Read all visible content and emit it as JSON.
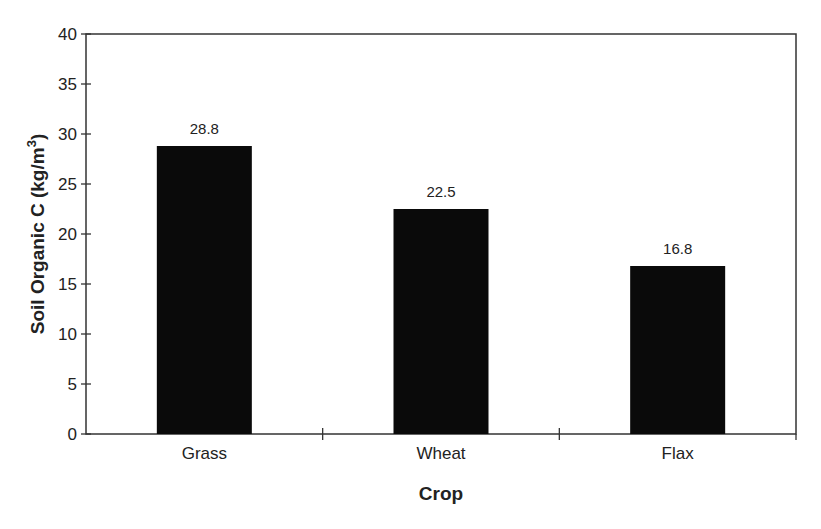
{
  "chart_data": {
    "type": "bar",
    "title": "",
    "categories": [
      "Grass",
      "Wheat",
      "Flax"
    ],
    "values": [
      28.8,
      22.5,
      16.8
    ],
    "data_labels": [
      "28.8",
      "22.5",
      "16.8"
    ],
    "xlabel": "Crop",
    "ylabel": "Soil Organic C (kg/m",
    "ylabel_superscript": "3",
    "ylabel_suffix": ")",
    "ylim": [
      0,
      40
    ],
    "yticks": [
      0,
      5,
      10,
      15,
      20,
      25,
      30,
      35,
      40
    ],
    "grid": false,
    "legend": null,
    "bar_color": "#0a0a0a",
    "frame": "box"
  }
}
